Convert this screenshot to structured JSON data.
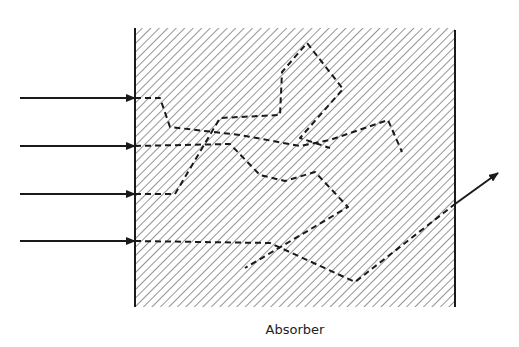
{
  "diagram": {
    "label": "Absorber",
    "colors": {
      "line": "#1a1a1a",
      "hatch": "#7a7a7a",
      "background": "#ffffff"
    },
    "absorber_box": {
      "x": 135,
      "y": 28,
      "width": 320,
      "height": 279
    },
    "incident_arrows": [
      {
        "y": 98,
        "x_start": 20,
        "x_end": 135
      },
      {
        "y": 146,
        "x_start": 20,
        "x_end": 135
      },
      {
        "y": 194,
        "x_start": 20,
        "x_end": 135
      },
      {
        "y": 241,
        "x_start": 20,
        "x_end": 135
      }
    ],
    "paths": [
      {
        "name": "path-1",
        "points": [
          [
            135,
            98
          ],
          [
            160,
            98
          ],
          [
            170,
            127
          ],
          [
            240,
            135
          ],
          [
            300,
            146
          ],
          [
            330,
            140
          ],
          [
            388,
            120
          ],
          [
            402,
            152
          ]
        ]
      },
      {
        "name": "path-2",
        "points": [
          [
            135,
            146
          ],
          [
            230,
            144
          ],
          [
            260,
            175
          ],
          [
            285,
            181
          ],
          [
            315,
            172
          ],
          [
            348,
            207
          ],
          [
            245,
            268
          ]
        ]
      },
      {
        "name": "path-3",
        "points": [
          [
            135,
            194
          ],
          [
            175,
            194
          ],
          [
            220,
            118
          ],
          [
            280,
            115
          ],
          [
            282,
            72
          ],
          [
            307,
            43
          ],
          [
            343,
            89
          ],
          [
            300,
            138
          ],
          [
            330,
            148
          ]
        ]
      },
      {
        "name": "path-4",
        "points": [
          [
            135,
            241
          ],
          [
            270,
            243
          ],
          [
            355,
            282
          ],
          [
            455,
            204
          ]
        ]
      }
    ],
    "exit_arrow": {
      "x1": 455,
      "y1": 204,
      "x2": 498,
      "y2": 173
    }
  }
}
